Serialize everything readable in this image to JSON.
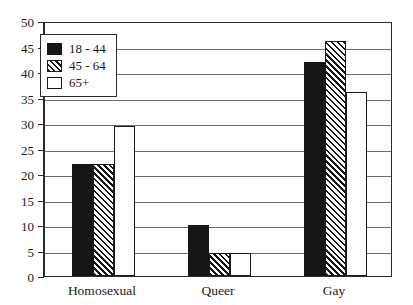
{
  "chart_data": {
    "type": "bar",
    "title": "",
    "xlabel": "",
    "ylabel": "",
    "ylim": [
      0,
      50
    ],
    "ytick_step": 5,
    "yticks": [
      0,
      5,
      10,
      15,
      20,
      25,
      30,
      35,
      40,
      45,
      50
    ],
    "ytick_labels": [
      "0",
      "5",
      "10",
      "15",
      "20",
      "25",
      "30",
      "35",
      "40",
      "45",
      "50"
    ],
    "categories": [
      "Homosexual",
      "Queer",
      "Gay"
    ],
    "series": [
      {
        "name": "18 - 44",
        "style": "solid",
        "values": [
          22,
          10,
          42
        ]
      },
      {
        "name": "45 - 64",
        "style": "hatch",
        "values": [
          22,
          4.5,
          46
        ]
      },
      {
        "name": "65+",
        "style": "open",
        "values": [
          29.5,
          4.5,
          36
        ]
      }
    ],
    "grid": true,
    "grid_axis": "y",
    "legend": [
      "18 - 44",
      "45 - 64",
      "65+"
    ],
    "legend_position": "upper-left-inside",
    "bar_grouping": "adjacent",
    "colors": {
      "solid_fill": "#161616",
      "hatch_fill": "#ffffff",
      "hatch_line": "#161616",
      "open_fill": "#ffffff",
      "outline": "#1a1a1a",
      "gridline": "#6d6d6d",
      "frame": "#2b2b2b",
      "text": "#1a1a1a",
      "background": "#ffffff"
    }
  }
}
